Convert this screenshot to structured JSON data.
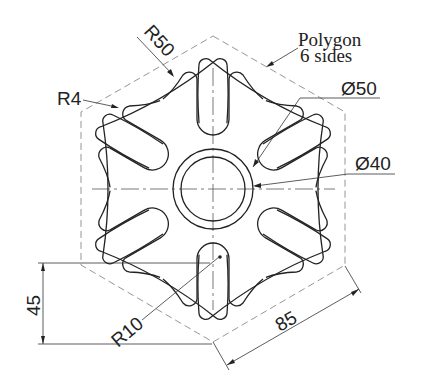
{
  "drawing": {
    "type": "mechanical drawing",
    "shape": "six-lobed plate inside hexagon",
    "annotations": {
      "polygon_note_line1": "Polygon",
      "polygon_note_line2": "6 sides",
      "r50": "R50",
      "r4": "R4",
      "r10": "R10",
      "dia50": "Ø50",
      "dia40": "Ø40",
      "dim45": "45",
      "dim85": "85"
    },
    "colors": {
      "outline": "#222222",
      "construction": "#8a8a8a",
      "background": "#ffffff"
    }
  }
}
